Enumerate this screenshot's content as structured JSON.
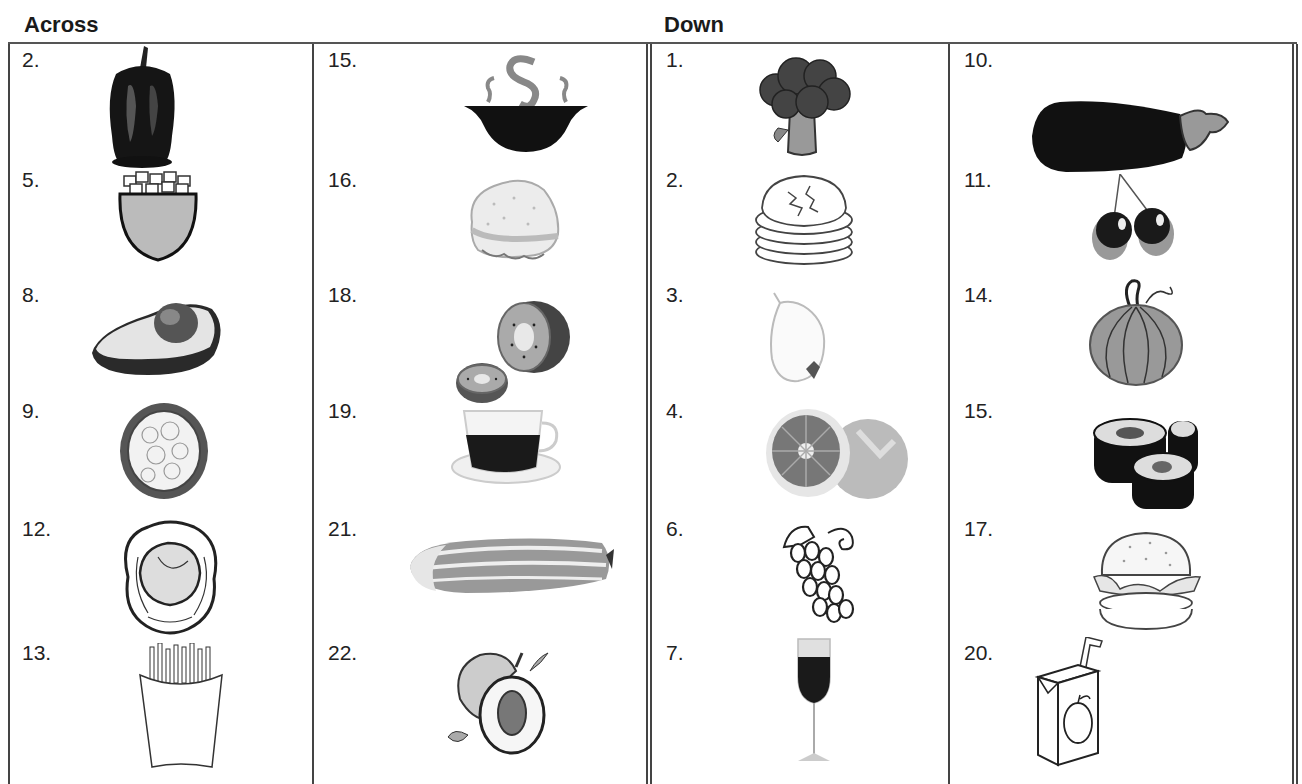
{
  "headings": {
    "across": "Across",
    "down": "Down"
  },
  "across": {
    "col1": [
      {
        "number": "2.",
        "item": "bell-pepper"
      },
      {
        "number": "5.",
        "item": "bowl-of-cereal"
      },
      {
        "number": "8.",
        "item": "avocado"
      },
      {
        "number": "9.",
        "item": "cauliflower"
      },
      {
        "number": "12.",
        "item": "cabbage"
      },
      {
        "number": "13.",
        "item": "french-fries"
      }
    ],
    "col2": [
      {
        "number": "15.",
        "item": "soup"
      },
      {
        "number": "16.",
        "item": "sandwich"
      },
      {
        "number": "18.",
        "item": "kiwi"
      },
      {
        "number": "19.",
        "item": "tea"
      },
      {
        "number": "21.",
        "item": "cucumber"
      },
      {
        "number": "22.",
        "item": "peach"
      }
    ]
  },
  "down": {
    "col1": [
      {
        "number": "1.",
        "item": "broccoli"
      },
      {
        "number": "2.",
        "item": "pancakes"
      },
      {
        "number": "3.",
        "item": "onion"
      },
      {
        "number": "4.",
        "item": "grapefruit"
      },
      {
        "number": "6.",
        "item": "grapes"
      },
      {
        "number": "7.",
        "item": "wine"
      }
    ],
    "col2": [
      {
        "number": "10.",
        "item": "eggplant"
      },
      {
        "number": "11.",
        "item": "cherries"
      },
      {
        "number": "14.",
        "item": "pumpkin"
      },
      {
        "number": "15.",
        "item": "sushi"
      },
      {
        "number": "17.",
        "item": "hamburger"
      },
      {
        "number": "20.",
        "item": "juice-box"
      }
    ]
  }
}
